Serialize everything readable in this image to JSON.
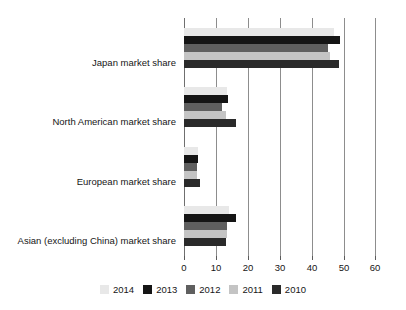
{
  "chart_data": {
    "type": "bar",
    "orientation": "horizontal",
    "title": "",
    "subtitle": "",
    "xlabel": "",
    "ylabel": "",
    "xlim": [
      0,
      60
    ],
    "xticks": [
      0,
      10,
      20,
      30,
      40,
      50,
      60
    ],
    "xtick_labels": [
      "0",
      "10",
      "20",
      "30",
      "40",
      "50",
      "60"
    ],
    "grid": true,
    "grid_axis": "x",
    "legend_position": "bottom",
    "categories": [
      "Japan market share",
      "North American market share",
      "European market share",
      "Asian (excluding China) market share"
    ],
    "series": [
      {
        "name": "2014",
        "color": "#e8e8e8",
        "values": [
          47.0,
          13.5,
          4.5,
          14.0
        ]
      },
      {
        "name": "2013",
        "color": "#151515",
        "values": [
          48.7,
          13.6,
          4.5,
          16.2
        ]
      },
      {
        "name": "2012",
        "color": "#5f5f5f",
        "values": [
          45.0,
          12.0,
          4.0,
          13.5
        ]
      },
      {
        "name": "2011",
        "color": "#c4c4c4",
        "values": [
          45.6,
          13.0,
          4.0,
          13.5
        ]
      },
      {
        "name": "2010",
        "color": "#2a2a2a",
        "values": [
          48.4,
          16.1,
          5.0,
          13.0
        ]
      }
    ]
  },
  "legend": {
    "items": [
      {
        "label": "2014",
        "color": "#e8e8e8"
      },
      {
        "label": "2013",
        "color": "#151515"
      },
      {
        "label": "2012",
        "color": "#5f5f5f"
      },
      {
        "label": "2011",
        "color": "#c4c4c4"
      },
      {
        "label": "2010",
        "color": "#2a2a2a"
      }
    ]
  },
  "colors": {
    "background": "#ffffff",
    "gridline": "#8d8d8d",
    "axis": "#6f6f6f",
    "text": "#161616"
  }
}
